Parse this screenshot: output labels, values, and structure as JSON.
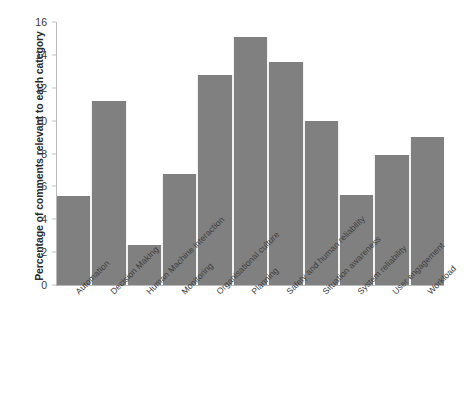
{
  "chart_data": {
    "type": "bar",
    "title": "",
    "xlabel": "",
    "ylabel": "Percentage of comments relevant to each category",
    "ylim": [
      0,
      16
    ],
    "ytick_step": 2,
    "yticks": [
      "0",
      "2",
      "4",
      "6",
      "8",
      "10",
      "12",
      "14",
      "16"
    ],
    "grid": false,
    "legend": "none",
    "bar_color": "#808080",
    "axis_color": "#b9b9b9",
    "background": "#ffffff",
    "x_label_rotation_deg": -45,
    "categories": [
      "Automation",
      "Decision Making",
      "Human Machine interaction",
      "Monitoring",
      "Organisational culture",
      "Planning",
      "Safety and human reliability",
      "Situation awareness",
      "System reliability",
      "User engagement",
      "Workload"
    ],
    "values": [
      5.4,
      11.2,
      2.45,
      6.75,
      12.75,
      15.1,
      13.55,
      10.0,
      5.5,
      7.9,
      9.0
    ]
  }
}
